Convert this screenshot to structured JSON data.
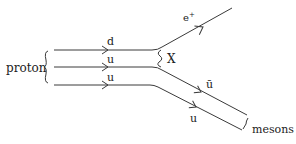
{
  "diagram": {
    "type": "feynman-diagram",
    "labels": {
      "proton": "proton",
      "quark_d": "d",
      "quark_u_middle": "u",
      "quark_u_bottom": "u",
      "boson": "X",
      "positron": "e",
      "positron_charge": "+",
      "antiquark": "ū",
      "quark_u_out": "u",
      "mesons": "mesons"
    },
    "particles": [
      {
        "name": "d",
        "role": "incoming quark"
      },
      {
        "name": "u",
        "role": "incoming quark"
      },
      {
        "name": "u",
        "role": "spectator quark"
      },
      {
        "name": "X",
        "role": "exchanged boson"
      },
      {
        "name": "e+",
        "role": "outgoing positron"
      },
      {
        "name": "ū",
        "role": "outgoing antiquark"
      },
      {
        "name": "u",
        "role": "outgoing quark"
      }
    ]
  }
}
